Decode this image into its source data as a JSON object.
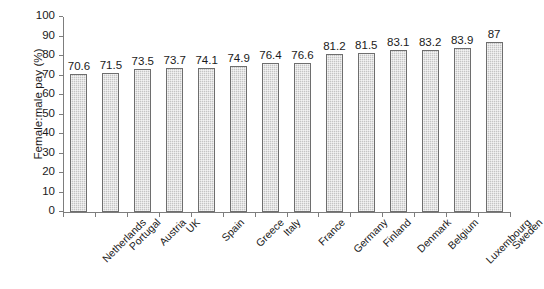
{
  "chart_data": {
    "type": "bar",
    "title": "",
    "subtitle": "",
    "xlabel": "",
    "ylabel": "Female:male pay (%)",
    "ylim": [
      0,
      100
    ],
    "yticks": [
      0,
      10,
      20,
      30,
      40,
      50,
      60,
      70,
      80,
      90,
      100
    ],
    "grid": false,
    "legend": false,
    "legend_position": "none",
    "orientation": "vertical",
    "bar_color": "#c4c4c4",
    "bar_edge_color": "#6e6e6e",
    "bar_pattern": "fine-dotted",
    "categories": [
      "Netherlands",
      "Portugal",
      "Austria",
      "UK",
      "Spain",
      "Greece",
      "Italy",
      "France",
      "Germany",
      "Finland",
      "Denmark",
      "Belgium",
      "Luxembourg",
      "Sweden"
    ],
    "values": [
      70.6,
      71.5,
      73.5,
      73.7,
      74.1,
      74.9,
      76.4,
      76.6,
      81.2,
      81.5,
      83.1,
      83.2,
      83.9,
      87
    ],
    "value_labels": [
      "70.6",
      "71.5",
      "73.5",
      "73.7",
      "74.1",
      "74.9",
      "76.4",
      "76.6",
      "81.2",
      "81.5",
      "83.1",
      "83.2",
      "83.9",
      "87"
    ],
    "ytick_labels": [
      "0",
      "10",
      "20",
      "30",
      "40",
      "50",
      "60",
      "70",
      "80",
      "90",
      "100"
    ]
  }
}
